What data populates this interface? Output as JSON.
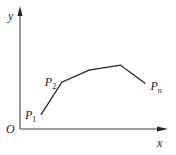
{
  "diagram": {
    "type": "polyline-on-axes",
    "axes": {
      "x_label": "x",
      "y_label": "y",
      "origin_label": "O"
    },
    "points": [
      {
        "name": "P",
        "subscript": "1",
        "x": 1.0,
        "y": 1.0
      },
      {
        "name": "P",
        "subscript": "2",
        "x": 2.0,
        "y": 3.3
      },
      {
        "name": "",
        "subscript": "",
        "x": 3.3,
        "y": 4.15
      },
      {
        "name": "",
        "subscript": "",
        "x": 4.8,
        "y": 4.5
      },
      {
        "name": "P",
        "subscript": "n",
        "x": 6.0,
        "y": 3.2
      }
    ],
    "x_range": [
      0,
      7.0
    ],
    "y_range": [
      0,
      6.0
    ],
    "colors": {
      "line": "#222222",
      "axis": "#444444",
      "background": "#ffffff"
    }
  }
}
